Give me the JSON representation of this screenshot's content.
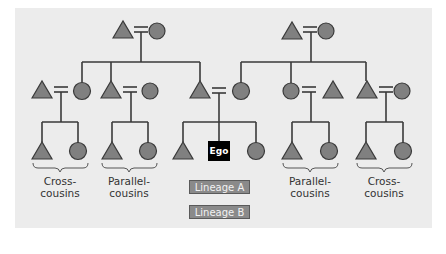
{
  "diagram": {
    "title": "",
    "symbols": {
      "male": "triangle",
      "female": "circle",
      "marriage": "double-line"
    },
    "colors": {
      "background": "#ececec",
      "symbol_fill": "#808080",
      "line": "#3a3a3a",
      "ego_box": "#000000",
      "lineage_box": "#8a8a8a"
    },
    "ego": {
      "label": "Ego"
    },
    "cousin_labels": [
      {
        "id": "far-left",
        "line1": "Cross-",
        "line2": "cousins"
      },
      {
        "id": "left",
        "line1": "Parallel-",
        "line2": "cousins"
      },
      {
        "id": "right",
        "line1": "Parallel-",
        "line2": "cousins"
      },
      {
        "id": "far-right",
        "line1": "Cross-",
        "line2": "cousins"
      }
    ],
    "legend": {
      "lineage_a": "Lineage A",
      "lineage_b": "Lineage B"
    }
  }
}
